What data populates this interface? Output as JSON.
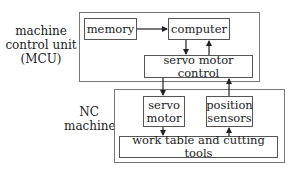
{
  "diagram": {
    "mcu": {
      "label": [
        "machine",
        "control unit",
        "(MCU)"
      ],
      "memory": "memory",
      "computer": "computer",
      "servo_motor_control": "servo motor control"
    },
    "nc_machine": {
      "label": [
        "NC",
        "machine"
      ],
      "servo_motor": [
        "servo",
        "motor"
      ],
      "position_sensors": [
        "position",
        "sensors"
      ],
      "work_table": "work table and cutting tools"
    },
    "connections": [
      {
        "from": "memory",
        "to": "computer"
      },
      {
        "from": "computer",
        "to": "servo motor control"
      },
      {
        "from": "servo motor control",
        "to": "computer"
      },
      {
        "from": "servo motor control",
        "to": "servo motor"
      },
      {
        "from": "position sensors",
        "to": "servo motor control"
      },
      {
        "from": "servo motor",
        "to": "work table and cutting tools"
      },
      {
        "from": "work table and cutting tools",
        "to": "position sensors"
      }
    ],
    "colors": {
      "line": "#222222",
      "border": "#555555",
      "background": "#ffffff"
    }
  }
}
